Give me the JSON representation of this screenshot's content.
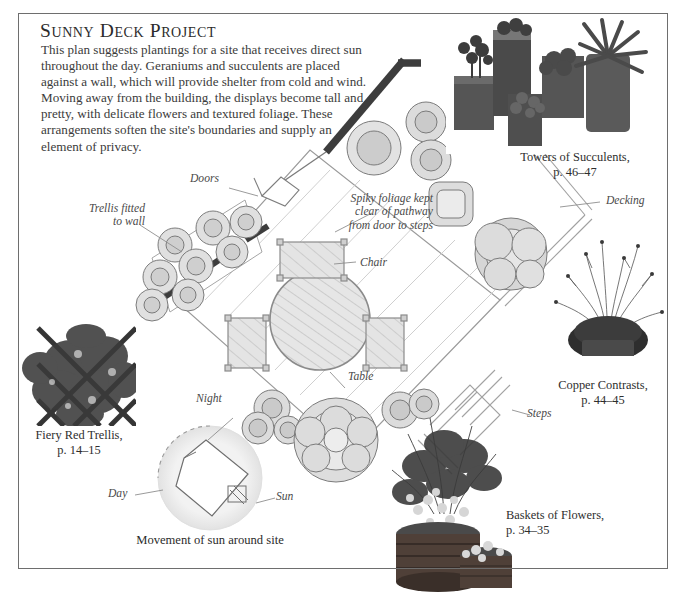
{
  "header": {
    "title": "Sunny Deck Project",
    "intro": "This plan suggests plantings for a site that receives direct sun throughout the day. Geraniums and succulents are placed against a wall, which will provide shelter from cold and wind. Moving away from the building, the displays become tall and pretty, with delicate flowers and textured foliage. These arrangements soften the site's boundaries and supply an element of privacy."
  },
  "annotations": {
    "doors": "Doors",
    "trellis_fitted": "Trellis fitted\nto wall",
    "spiky_foliage": "Spiky foliage kept\nclear of pathway\nfrom door to steps",
    "decking": "Decking",
    "chair": "Chair",
    "table": "Table",
    "steps": "Steps",
    "night": "Night",
    "day": "Day",
    "sun": "Sun"
  },
  "captions": [
    {
      "name": "towers-of-succulents",
      "title": "Towers of Succulents,",
      "pages": "p. 46–47"
    },
    {
      "name": "copper-contrasts",
      "title": "Copper Contrasts,",
      "pages": "p. 44–45"
    },
    {
      "name": "baskets-of-flowers",
      "title": "Baskets of Flowers,",
      "pages": "p. 34–35"
    },
    {
      "name": "fiery-red-trellis",
      "title": "Fiery Red Trellis,",
      "pages": "p. 14–15"
    }
  ],
  "sun_diagram": {
    "caption": "Movement of sun around site"
  },
  "colors": {
    "frame": "#6e6e6e",
    "wall": "#3a3a3a",
    "plan_line": "#8d8d8d",
    "plant_fill": "#d8d8d8",
    "plant_core": "#bdbdbd",
    "deck_fill": "#ffffff",
    "text": "#2e2e2e"
  }
}
